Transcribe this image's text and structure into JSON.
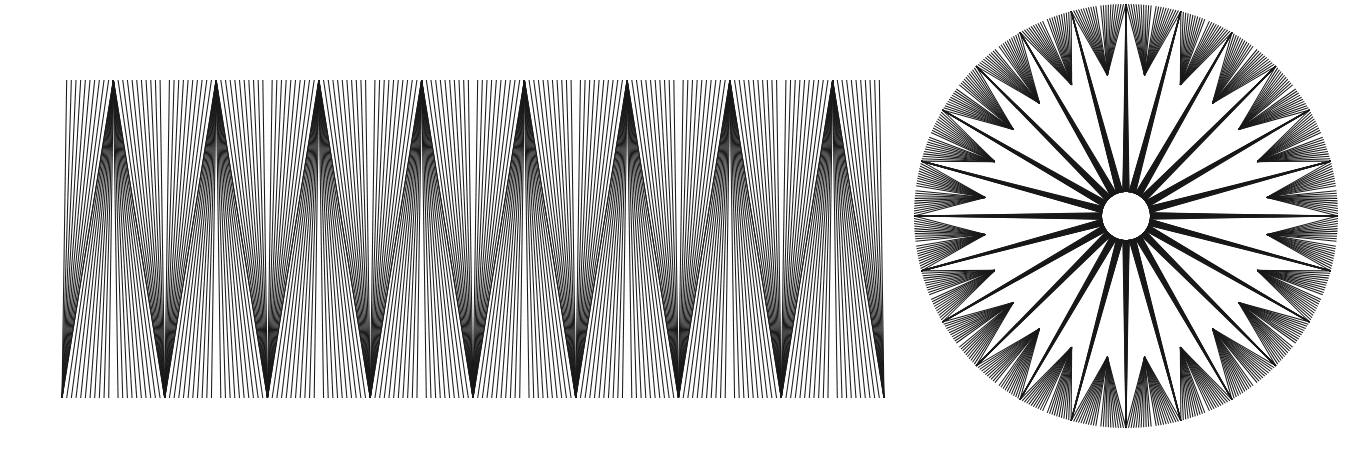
{
  "page": {
    "background_color": "#ffffff",
    "width": 1359,
    "height": 470
  },
  "figure": {
    "name": "dual-panel-line-illusion",
    "stroke_color": "#1a1a1a",
    "stroke_width": 1.05,
    "panels": [
      {
        "id": "linear-zigzag-band",
        "label": "Linear zigzag fan band",
        "type": "cartesian",
        "x_start": 62,
        "x_end": 884,
        "y_top": 80,
        "y_bottom": 398,
        "periods": 8,
        "lines_per_half_period": 11,
        "top_vertex_count": 8,
        "bottom_vertex_count": 8,
        "phase_offset": 0.5,
        "vertex_jitter": 0.0,
        "notes": "Each straight line runs from a point on the top edge to a point on the bottom edge. Top endpoints bunch into 8 sharp apex clusters; bottom endpoints bunch into 8 apex clusters offset by half a period, producing alternating dark wedges."
      },
      {
        "id": "radial-starburst-rosette",
        "label": "Radial starburst rosette",
        "type": "polar",
        "center_x": 1126,
        "center_y": 216,
        "inner_hole_radius": 24,
        "mid_ring_radius": 142,
        "outer_radius": 212,
        "spikes": 24,
        "lines_per_half_spike": 11,
        "total_rays": 528,
        "notes": "Polar version of the left panel: radii replace the vertical extent and angle replaces the horizontal axis. Lines converge alternately at 24 outer spike tips and 24 inner ring notches."
      }
    ]
  },
  "chart_data": {
    "type": "line",
    "xlabel": "",
    "ylabel": "",
    "grid": false,
    "legend": "none",
    "series": [
      {
        "name": "linear-zigzag-band",
        "geometry": "cartesian-straight-lines",
        "segments": 176,
        "x_range": [
          62,
          884
        ],
        "y_range": [
          80,
          398
        ],
        "periods": 8
      },
      {
        "name": "radial-starburst-rosette",
        "geometry": "polar-straight-rays",
        "center": [
          1126,
          216
        ],
        "r_range": [
          24,
          212
        ],
        "spikes": 24,
        "segments": 528
      }
    ]
  }
}
